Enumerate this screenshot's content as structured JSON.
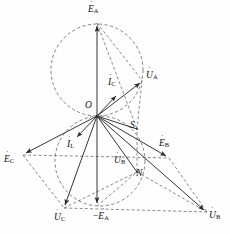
{
  "figure": {
    "type": "phasor-diagram",
    "title": "",
    "background_color": "#fefefe",
    "line_color": "#2b2b2b",
    "dashed_color": "#555555",
    "width": 230,
    "height": 235
  },
  "labels": {
    "E_A": {
      "text": "E",
      "sub": "A",
      "dotted": true,
      "x": 88,
      "y": 5
    },
    "E_B": {
      "text": "E",
      "sub": "B",
      "dotted": true,
      "x": 159,
      "y": 139
    },
    "E_C": {
      "text": "E",
      "sub": "C",
      "dotted": true,
      "x": 4,
      "y": 155
    },
    "E_A_neg": {
      "text": "E",
      "sub": "A",
      "prefix": "−",
      "dotted": true,
      "x": 95,
      "y": 212
    },
    "U_A": {
      "text": "U",
      "sub": "A",
      "dotted": true,
      "x": 146,
      "y": 71
    },
    "U_B_mid": {
      "text": "U",
      "sub": "B",
      "dotted": true,
      "x": 114,
      "y": 156
    },
    "U_B": {
      "text": "U",
      "sub": "B",
      "dotted": true,
      "x": 209,
      "y": 211
    },
    "U_C": {
      "text": "U",
      "sub": "C",
      "dotted": true,
      "x": 54,
      "y": 213
    },
    "I_C": {
      "text": "I",
      "sub": "C",
      "dotted": true,
      "x": 108,
      "y": 78
    },
    "I_L": {
      "text": "I",
      "sub": "L",
      "dotted": true,
      "x": 67,
      "y": 140
    },
    "O": {
      "text": "O",
      "sub": "",
      "dotted": false,
      "x": 85,
      "y": 101
    },
    "S": {
      "text": "S",
      "sub": "",
      "dotted": false,
      "x": 130,
      "y": 121
    },
    "N": {
      "text": "N",
      "sub": "",
      "dotted": false,
      "x": 136,
      "y": 169
    }
  },
  "geometry": {
    "origin": {
      "name": "O",
      "x": 97,
      "y": 116
    },
    "points": {
      "E_A_tip": {
        "x": 97,
        "y": 23
      },
      "E_A_neg_tip": {
        "x": 97,
        "y": 206
      },
      "E_B_tip": {
        "x": 169,
        "y": 158
      },
      "E_C_tip": {
        "x": 23,
        "y": 155
      },
      "U_A_tip": {
        "x": 142,
        "y": 80
      },
      "U_B_tip": {
        "x": 207,
        "y": 212
      },
      "U_C_tip": {
        "x": 64,
        "y": 208
      },
      "I_C_tip": {
        "x": 119,
        "y": 93
      },
      "I_L_tip": {
        "x": 79,
        "y": 135
      },
      "S": {
        "x": 137,
        "y": 129
      },
      "N": {
        "x": 137,
        "y": 172
      }
    },
    "circles": [
      {
        "name": "upper-locus-circle",
        "cx": 97,
        "cy": 70,
        "r": 46
      },
      {
        "name": "lower-locus-circle",
        "cx": 100,
        "cy": 161,
        "r": 45
      }
    ]
  },
  "solid_vectors": [
    {
      "name": "vector-E-A",
      "from": "origin",
      "to": "E_A_tip"
    },
    {
      "name": "vector-neg-E-A",
      "from": "origin",
      "to": "E_A_neg_tip"
    },
    {
      "name": "vector-E-B",
      "from": "origin",
      "to": "E_B_tip"
    },
    {
      "name": "vector-E-C",
      "from": "origin",
      "to": "E_C_tip"
    },
    {
      "name": "vector-U-A",
      "from": "origin",
      "to": "U_A_tip"
    },
    {
      "name": "vector-U-B",
      "from": "origin",
      "to": "U_B_tip"
    },
    {
      "name": "vector-U-C",
      "from": "origin",
      "to": "U_C_tip"
    },
    {
      "name": "vector-I-C",
      "from": "origin",
      "to": "I_C_tip"
    },
    {
      "name": "vector-I-L",
      "from": "origin",
      "to": "I_L_tip"
    }
  ],
  "dashed_lines": [
    {
      "name": "line-E-A-to-U-A"
    },
    {
      "name": "line-E-A-to-S"
    },
    {
      "name": "line-U-A-to-N"
    },
    {
      "name": "line-S-to-N"
    },
    {
      "name": "line-E-C-to-U-C"
    },
    {
      "name": "line-E-C-to-E-B"
    },
    {
      "name": "line-U-C-to-N"
    },
    {
      "name": "line-U-C-to-U-B"
    },
    {
      "name": "line-E-B-to-U-B"
    },
    {
      "name": "line-N-to-U-B"
    },
    {
      "name": "line-neg-E-A-to-N"
    }
  ]
}
